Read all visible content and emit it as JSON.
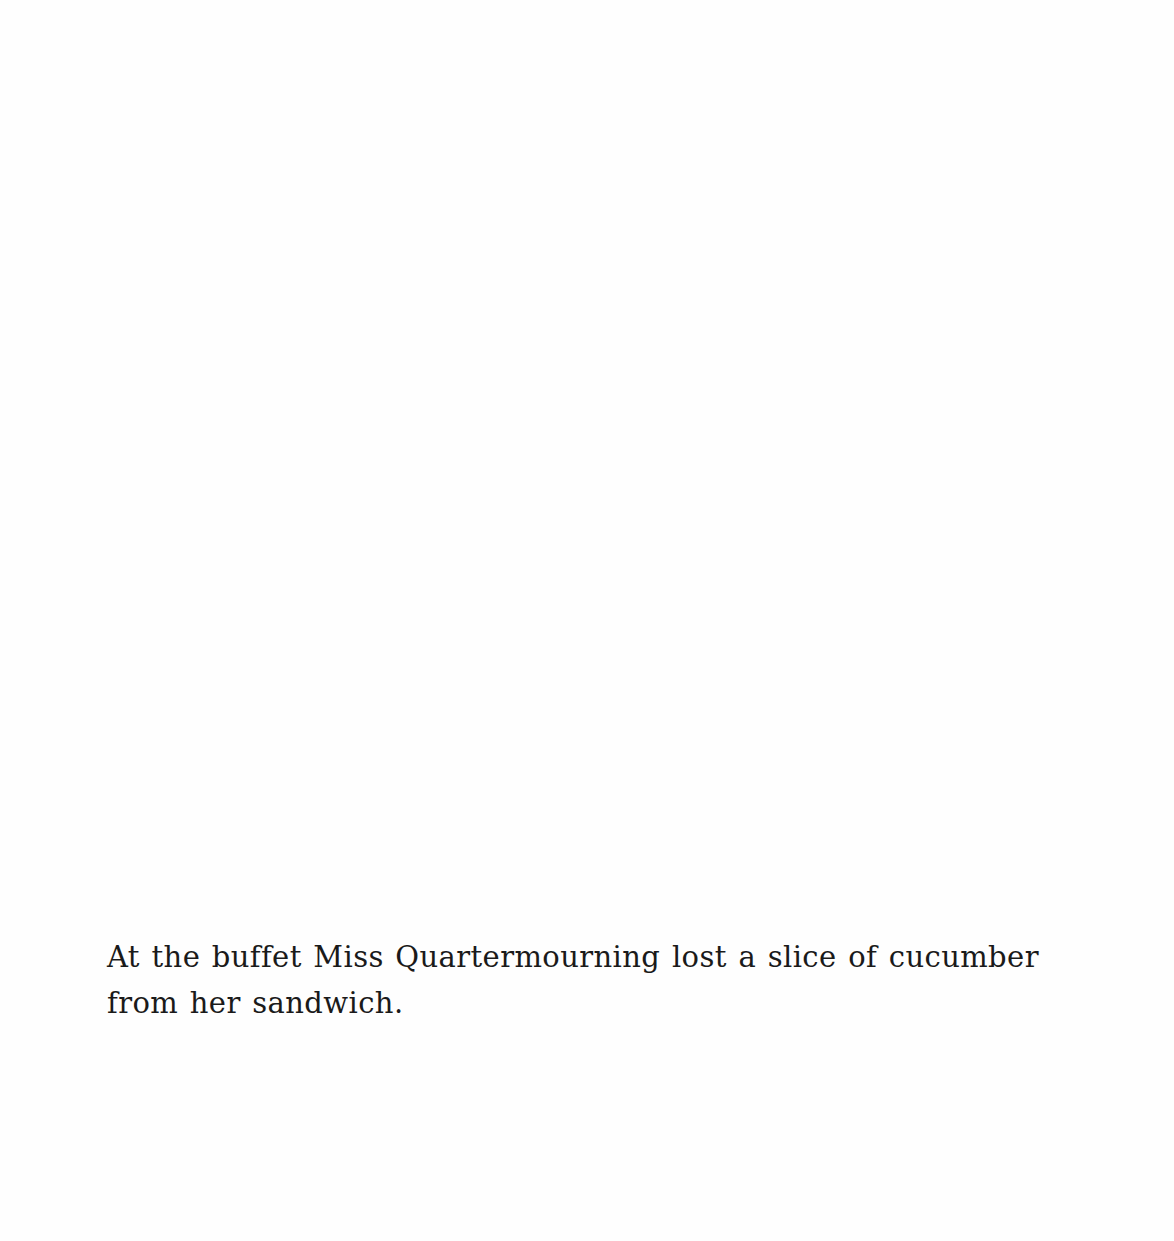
{
  "page": {
    "caption_lines": [
      "At the buffet Miss Quartermourning lost a slice of cucumber",
      "from her sandwich."
    ]
  }
}
